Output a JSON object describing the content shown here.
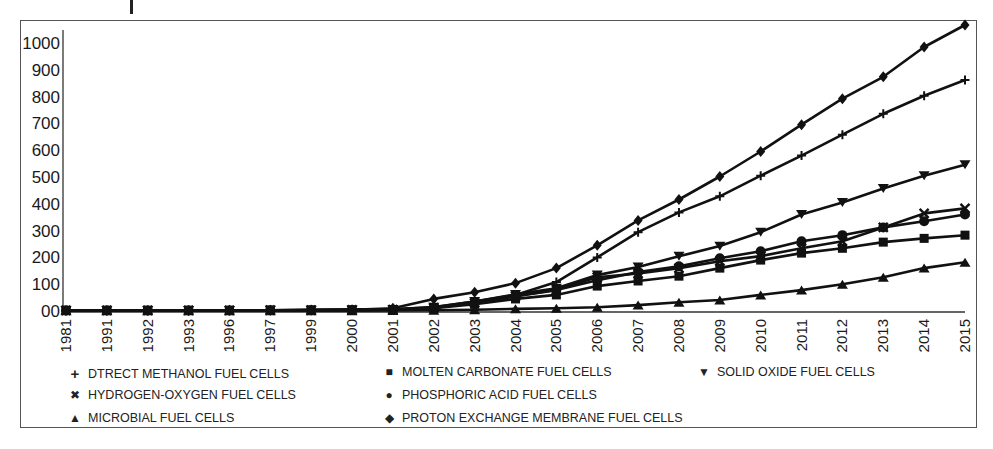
{
  "chart_data": {
    "type": "line",
    "title": "",
    "xlabel": "",
    "ylabel": "",
    "ylim": [
      0,
      1000
    ],
    "y_ticks": [
      "00",
      "100",
      "200",
      "300",
      "400",
      "500",
      "600",
      "700",
      "800",
      "900",
      "1000"
    ],
    "categories": [
      "1981",
      "1991",
      "1992",
      "1993",
      "1996",
      "1997",
      "1999",
      "2000",
      "2001",
      "2002",
      "2003",
      "2004",
      "2005",
      "2006",
      "2007",
      "2008",
      "2009",
      "2010",
      "2011",
      "2012",
      "2013",
      "2014",
      "2015"
    ],
    "grid": false,
    "legend_position": "bottom",
    "series": [
      {
        "name": "DTRECT METHANOL FUEL CELLS",
        "marker": "plus",
        "values": [
          2,
          2,
          2,
          2,
          2,
          3,
          3,
          4,
          6,
          15,
          35,
          60,
          108,
          200,
          294,
          368,
          428,
          505,
          580,
          658,
          736,
          803,
          862
        ]
      },
      {
        "name": "MOLTEN CARBONATE FUEL CELLS",
        "marker": "square",
        "values": [
          3,
          3,
          3,
          3,
          3,
          3,
          4,
          4,
          5,
          10,
          25,
          45,
          60,
          93,
          112,
          130,
          160,
          190,
          216,
          234,
          257,
          271,
          283
        ]
      },
      {
        "name": "SOLID OXIDE FUEL CELLS",
        "marker": "triangle-down",
        "values": [
          2,
          2,
          2,
          2,
          2,
          3,
          3,
          4,
          6,
          14,
          35,
          62,
          85,
          134,
          164,
          204,
          242,
          294,
          360,
          405,
          457,
          505,
          546
        ]
      },
      {
        "name": "HYDROGEN-OXYGEN FUEL CELLS",
        "marker": "x",
        "values": [
          2,
          2,
          2,
          2,
          2,
          3,
          3,
          4,
          5,
          12,
          30,
          55,
          80,
          126,
          140,
          160,
          186,
          205,
          234,
          260,
          312,
          364,
          383
        ]
      },
      {
        "name": "PHOSPHORIC ACID FUEL CELLS",
        "marker": "circle",
        "values": [
          2,
          2,
          2,
          2,
          2,
          3,
          3,
          4,
          5,
          12,
          30,
          55,
          78,
          115,
          145,
          167,
          197,
          223,
          260,
          283,
          312,
          335,
          360
        ]
      },
      {
        "name": "MICROBIAL FUEL CELLS",
        "marker": "triangle-up",
        "values": [
          1,
          1,
          1,
          1,
          1,
          1,
          1,
          1,
          2,
          3,
          5,
          8,
          10,
          14,
          22,
          33,
          41,
          60,
          78,
          100,
          126,
          160,
          182
        ]
      },
      {
        "name": "PROTON EXCHANGE MEMBRANE FUEL CELLS",
        "marker": "diamond",
        "values": [
          2,
          2,
          2,
          2,
          3,
          3,
          4,
          5,
          10,
          45,
          70,
          104,
          160,
          245,
          338,
          416,
          502,
          595,
          695,
          792,
          874,
          985,
          1067
        ]
      }
    ]
  },
  "legend": [
    {
      "label": "DTRECT METHANOL FUEL CELLS",
      "symbol": "+"
    },
    {
      "label": "MOLTEN CARBONATE FUEL CELLS",
      "symbol": "■"
    },
    {
      "label": "SOLID OXIDE FUEL CELLS",
      "symbol": "▼"
    },
    {
      "label": "HYDROGEN-OXYGEN FUEL CELLS",
      "symbol": "✖"
    },
    {
      "label": "PHOSPHORIC ACID FUEL CELLS",
      "symbol": "●"
    },
    {
      "label": "MICROBIAL FUEL CELLS",
      "symbol": "▲"
    },
    {
      "label": "PROTON EXCHANGE MEMBRANE FUEL CELLS",
      "symbol": "◆"
    }
  ],
  "colors": {
    "line": "#111111",
    "frame": "#555555",
    "text": "#1a1a1a"
  }
}
